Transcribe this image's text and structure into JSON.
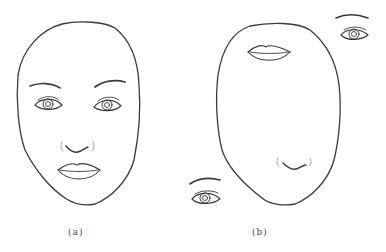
{
  "figure": {
    "panels": [
      {
        "label": "(a)",
        "description": "Face outline with features in normal arrangement: two eyes with eyebrows, nose, lips"
      },
      {
        "label": "(b)",
        "description": "Face outline with scrambled features: lips at top of face, nose at bottom, eyes outside the face outline"
      }
    ],
    "colors": {
      "stroke": "#333333",
      "background": "#ffffff"
    }
  }
}
